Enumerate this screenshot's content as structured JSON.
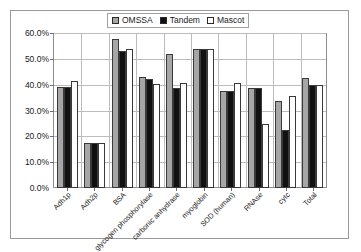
{
  "chart_data": {
    "type": "bar",
    "title": "",
    "xlabel": "",
    "ylabel": "",
    "ylim": [
      0,
      0.6
    ],
    "grid": true,
    "legend_position": "top-center",
    "ytick_labels": [
      "60.0%",
      "50.0%",
      "40.0%",
      "30.0%",
      "20.0%",
      "10.0%",
      "0.0%"
    ],
    "ytick_values": [
      0.6,
      0.5,
      0.4,
      0.3,
      0.2,
      0.1,
      0.0
    ],
    "categories": [
      "Adh1p",
      "Adh2p",
      "BSA",
      "glycogen phosphorylase",
      "carbonic anhydrase",
      "myoglobin",
      "SOD (human)",
      "RNAse",
      "cytc",
      "Total"
    ],
    "series": [
      {
        "name": "OMSSA",
        "color": "#a6a6a6",
        "values": [
          0.39,
          0.175,
          0.575,
          0.428,
          0.518,
          0.54,
          0.376,
          0.386,
          0.335,
          0.425
        ]
      },
      {
        "name": "Tandem",
        "color": "#111111",
        "values": [
          0.39,
          0.175,
          0.53,
          0.421,
          0.388,
          0.54,
          0.376,
          0.386,
          0.225,
          0.4
        ]
      },
      {
        "name": "Mascot",
        "color": "#ffffff",
        "values": [
          0.415,
          0.175,
          0.54,
          0.404,
          0.405,
          0.54,
          0.406,
          0.246,
          0.356,
          0.4
        ]
      }
    ]
  },
  "legend": {
    "entries": [
      {
        "label": "OMSSA",
        "swatch": "gray-swatch-icon"
      },
      {
        "label": "Tandem",
        "swatch": "black-swatch-icon"
      },
      {
        "label": "Mascot",
        "swatch": "white-swatch-icon"
      }
    ]
  }
}
